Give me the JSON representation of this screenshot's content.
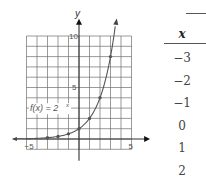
{
  "chart_data": {
    "type": "line",
    "title": "",
    "function_label": "f(x) = 2^x",
    "function_label_display": "f(x) = 2",
    "function_label_exponent": "x",
    "xlabel": "x",
    "ylabel": "y",
    "xlim": [
      -5,
      5
    ],
    "ylim": [
      -1,
      10
    ],
    "x_ticks_labeled": [
      "-5",
      "5"
    ],
    "y_ticks_labeled": [
      "5",
      "10"
    ],
    "grid": true,
    "series": [
      {
        "name": "f(x) = 2^x",
        "points": [
          {
            "x": -3,
            "y": 0.125
          },
          {
            "x": -2,
            "y": 0.25
          },
          {
            "x": -1,
            "y": 0.5
          },
          {
            "x": 0,
            "y": 1
          },
          {
            "x": 1,
            "y": 2
          },
          {
            "x": 2,
            "y": 4
          },
          {
            "x": 3,
            "y": 8
          }
        ]
      }
    ]
  },
  "graph": {
    "x_axis_label": "x",
    "y_axis_label": "y",
    "tick_neg5": "−5",
    "tick_pos5": "5",
    "tick_y5": "5",
    "tick_y10": "10",
    "curve_label": "f(x) = 2",
    "curve_label_exp": "x",
    "colors": {
      "grid": "#6e6e6e",
      "axis": "#333333",
      "curve": "#555555",
      "point": "#555555",
      "text": "#555555"
    }
  },
  "table": {
    "header": "x",
    "rows": [
      "−3",
      "−2",
      "−1",
      "0",
      "1",
      "2",
      "3"
    ]
  }
}
